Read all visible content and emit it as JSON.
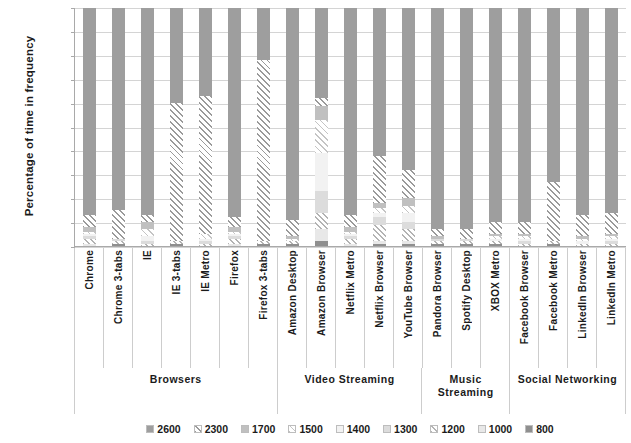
{
  "chart_data": {
    "type": "bar",
    "stacked": true,
    "title": "",
    "xlabel": "",
    "ylabel": "Percentage of time in frequency",
    "ylim": [
      0,
      100
    ],
    "ytick_labels": [
      "100%",
      "90%",
      "80%",
      "70%",
      "60%",
      "50%",
      "40%",
      "30%",
      "20%",
      "10%",
      "0%"
    ],
    "ytick_values": [
      100,
      90,
      80,
      70,
      60,
      50,
      40,
      30,
      20,
      10,
      0
    ],
    "grid": true,
    "legend_position": "bottom",
    "legend": [
      "2600",
      "2300",
      "1700",
      "1500",
      "1400",
      "1300",
      "1200",
      "1000",
      "800"
    ],
    "series_names": [
      "2600",
      "2300",
      "1700",
      "1500",
      "1400",
      "1300",
      "1200",
      "1000",
      "800"
    ],
    "categories": [
      "Chrome",
      "Chrome 3-tabs",
      "IE",
      "IE 3-tabs",
      "IE Metro",
      "Firefox",
      "Firefox 3-tabs",
      "Amazon Desktop",
      "Amazon Browser",
      "Netflix Metro",
      "Netflix Browser",
      "YouTube Browser",
      "Pandora Browser",
      "Spotify Desktop",
      "XBOX Metro",
      "Facebook Browser",
      "Facebook Metro",
      "LinkedIn Browser",
      "LinkedIn Metro"
    ],
    "groups": [
      {
        "label": "Browsers",
        "span": 7
      },
      {
        "label": "Video Streaming",
        "span": 5
      },
      {
        "label": "Music Streaming",
        "span": 3
      },
      {
        "label": "Social Networking",
        "span": 4
      }
    ],
    "series": [
      {
        "name": "2600",
        "values": [
          87,
          85,
          87,
          40,
          37,
          88,
          22,
          89,
          38,
          87,
          62,
          68,
          93,
          93,
          90,
          90,
          73,
          87,
          86
        ]
      },
      {
        "name": "2300",
        "values": [
          5,
          12,
          3,
          58,
          58,
          4,
          76,
          7,
          3,
          5,
          20,
          12,
          3,
          4,
          5,
          5,
          25,
          9,
          9
        ]
      },
      {
        "name": "1700",
        "values": [
          2,
          0,
          3,
          0,
          0,
          2,
          0,
          1,
          6,
          2,
          2,
          3,
          1,
          0,
          1,
          1,
          0,
          1,
          1
        ]
      },
      {
        "name": "1500",
        "values": [
          1,
          0,
          3,
          0,
          2,
          1,
          0,
          1,
          14,
          1,
          2,
          3,
          0,
          0,
          1,
          1,
          0,
          1,
          1
        ]
      },
      {
        "name": "1400",
        "values": [
          1,
          0,
          2,
          0,
          1,
          1,
          0,
          0,
          16,
          1,
          2,
          4,
          0,
          0,
          1,
          1,
          0,
          1,
          1
        ]
      },
      {
        "name": "1300",
        "values": [
          1,
          1,
          1,
          0,
          1,
          1,
          0,
          0,
          9,
          1,
          3,
          3,
          1,
          1,
          0,
          1,
          0,
          0,
          1
        ]
      },
      {
        "name": "1200",
        "values": [
          2,
          1,
          1,
          1,
          1,
          2,
          1,
          1,
          7,
          2,
          7,
          5,
          1,
          1,
          1,
          1,
          1,
          1,
          1
        ]
      },
      {
        "name": "1000",
        "values": [
          1,
          0,
          0,
          0,
          0,
          1,
          0,
          0,
          5,
          1,
          1,
          1,
          0,
          0,
          0,
          0,
          0,
          0,
          0
        ]
      },
      {
        "name": "800",
        "values": [
          0,
          1,
          0,
          1,
          0,
          0,
          1,
          1,
          2,
          0,
          1,
          1,
          1,
          1,
          1,
          0,
          1,
          0,
          0
        ]
      }
    ]
  }
}
